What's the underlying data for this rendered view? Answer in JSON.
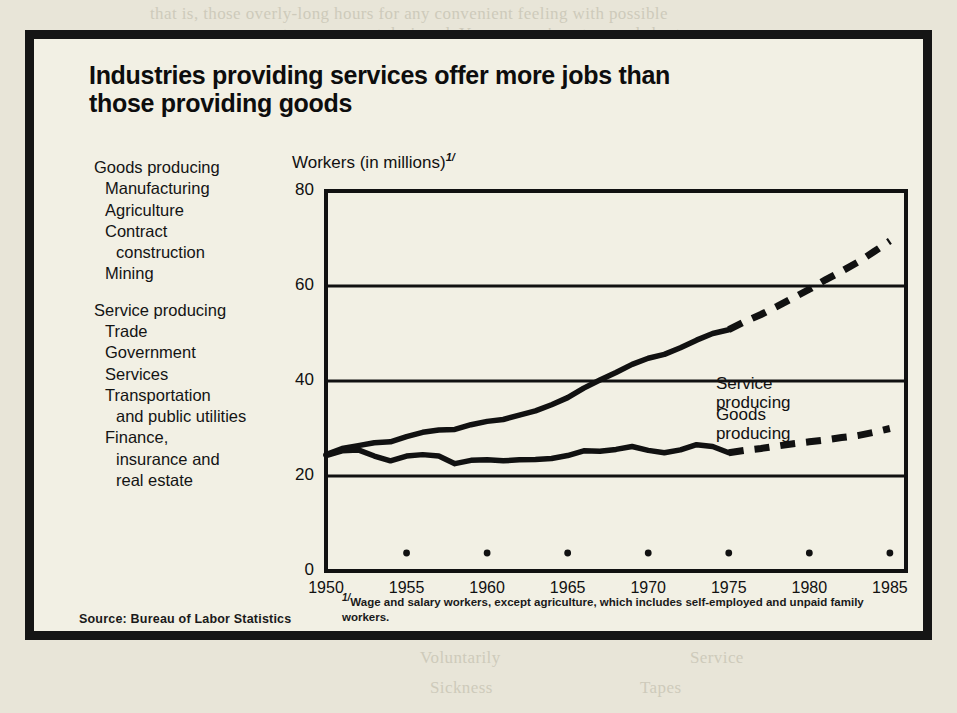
{
  "figure": {
    "title": "Industries providing services offer more jobs than those providing goods",
    "source": "Source: Bureau of Labor Statistics",
    "footnote_marker": "1/",
    "footnote": "Wage and salary workers, except agriculture, which includes self-employed and unpaid family workers."
  },
  "category_lists": [
    {
      "heading": "Goods producing",
      "items": [
        "Manufacturing",
        "Agriculture",
        "Contract",
        "construction",
        "Mining"
      ],
      "indent": [
        "sub",
        "sub",
        "sub",
        "sub2",
        "sub"
      ]
    },
    {
      "heading": "Service producing",
      "items": [
        "Trade",
        "Government",
        "Services",
        "Transportation",
        "and public utilities",
        "Finance,",
        "insurance and",
        "real estate"
      ],
      "indent": [
        "sub",
        "sub",
        "sub",
        "sub",
        "sub2",
        "sub",
        "sub2",
        "sub2"
      ]
    }
  ],
  "chart_data": {
    "type": "line",
    "title": "Industries providing services offer more jobs than those providing goods",
    "xlabel": "",
    "ylabel": "Workers (in millions)",
    "ylabel_footnote": "1/",
    "xlim": [
      1950,
      1986
    ],
    "ylim": [
      0,
      80
    ],
    "ytick_labels": [
      "0",
      "20",
      "40",
      "60",
      "80"
    ],
    "yticks": [
      0,
      20,
      40,
      60,
      80
    ],
    "xtick_labels": [
      "1950",
      "1955",
      "1960",
      "1965",
      "1970",
      "1975",
      "1980",
      "1985"
    ],
    "xticks": [
      1950,
      1955,
      1960,
      1965,
      1970,
      1975,
      1980,
      1985
    ],
    "grid": "horizontal",
    "legend_position": "inline-right",
    "series": [
      {
        "name": "Service producing",
        "label_line1": "Service",
        "label_line2": "producing",
        "style": "solid-then-dashed",
        "dash_begins": 1975,
        "x": [
          1950,
          1951,
          1952,
          1953,
          1954,
          1955,
          1956,
          1957,
          1958,
          1959,
          1960,
          1961,
          1962,
          1963,
          1964,
          1965,
          1966,
          1967,
          1968,
          1969,
          1970,
          1971,
          1972,
          1973,
          1974,
          1975,
          1976,
          1977,
          1978,
          1979,
          1980,
          1981,
          1982,
          1983,
          1984,
          1985
        ],
        "y": [
          24.5,
          25.8,
          26.4,
          27.0,
          27.2,
          28.3,
          29.2,
          29.7,
          29.8,
          30.8,
          31.5,
          31.9,
          32.8,
          33.7,
          35.0,
          36.5,
          38.5,
          40.2,
          41.8,
          43.5,
          44.8,
          45.6,
          47.0,
          48.6,
          50.0,
          50.8,
          52.5,
          54.0,
          55.7,
          57.5,
          59.3,
          61.3,
          63.1,
          65.0,
          67.2,
          69.5
        ]
      },
      {
        "name": "Goods producing",
        "label_line1": "Goods",
        "label_line2": "producing",
        "style": "solid-then-dashed",
        "dash_begins": 1975,
        "x": [
          1950,
          1951,
          1952,
          1953,
          1954,
          1955,
          1956,
          1957,
          1958,
          1959,
          1960,
          1961,
          1962,
          1963,
          1964,
          1965,
          1966,
          1967,
          1968,
          1969,
          1970,
          1971,
          1972,
          1973,
          1974,
          1975,
          1976,
          1977,
          1978,
          1979,
          1980,
          1981,
          1982,
          1983,
          1984,
          1985
        ],
        "y": [
          24.3,
          25.3,
          25.5,
          24.2,
          23.2,
          24.2,
          24.5,
          24.2,
          22.6,
          23.3,
          23.4,
          23.2,
          23.4,
          23.5,
          23.7,
          24.3,
          25.3,
          25.2,
          25.6,
          26.2,
          25.4,
          24.9,
          25.5,
          26.6,
          26.2,
          24.9,
          25.4,
          25.8,
          26.3,
          26.8,
          27.2,
          27.6,
          28.1,
          28.5,
          29.2,
          30.0
        ]
      }
    ],
    "axis_dots": [
      1955,
      1960,
      1965,
      1970,
      1975,
      1980,
      1985
    ],
    "note": "Axis marker dots sit just above the x axis at each 5-year tick after 1950."
  },
  "ghost_text": [
    {
      "t": "that is, those overly-long hours for any convenient feeling with possible",
      "x": 150,
      "y": 4
    },
    {
      "t": "a permanent arrangement designed. You may arrive at a good short",
      "x": 200,
      "y": 24
    },
    {
      "t": "work that can be accomplished in a fixed number of hours every day.",
      "x": 230,
      "y": 44
    },
    {
      "t": "Those who may need to be more nor less then the advantages of ways to",
      "x": 250,
      "y": 62
    },
    {
      "t": "make the work at hand difficult to reach its ways with the level of",
      "x": 250,
      "y": 84
    },
    {
      "t": "attendance, much attention to the attempt by such a personnel use",
      "x": 250,
      "y": 106
    },
    {
      "t": "of rather than a permanent situation, safety, after a reasonable",
      "x": 250,
      "y": 128
    },
    {
      "t": "and of the work force time to be spend in the house of",
      "x": 250,
      "y": 150
    },
    {
      "t": "the amount of work. These not likely to be placed on",
      "x": 250,
      "y": 172
    },
    {
      "t": "Chapter 12. The Effects of Shorter Hours and Benefits",
      "x": 90,
      "y": 348
    },
    {
      "t": "of labor on the amount of work that a personnel may require",
      "x": 150,
      "y": 372
    },
    {
      "t": "to maintain on their own schedules, after much more to",
      "x": 160,
      "y": 394
    },
    {
      "t": "the use of a relatively large body of the work force on a",
      "x": 160,
      "y": 416
    },
    {
      "t": "possibly with the most of the manner considering the part time, work",
      "x": 150,
      "y": 440
    },
    {
      "t": "and allow the workers to limit to a shorter day. Particular to those who are",
      "x": 120,
      "y": 462
    },
    {
      "t": "more than the usual of those more likely to be able to set their hours",
      "x": 140,
      "y": 484
    },
    {
      "t": "Voluntarily",
      "x": 420,
      "y": 648
    },
    {
      "t": "Service",
      "x": 690,
      "y": 648
    },
    {
      "t": "Sickness",
      "x": 430,
      "y": 678
    },
    {
      "t": "Tapes",
      "x": 640,
      "y": 678
    }
  ]
}
